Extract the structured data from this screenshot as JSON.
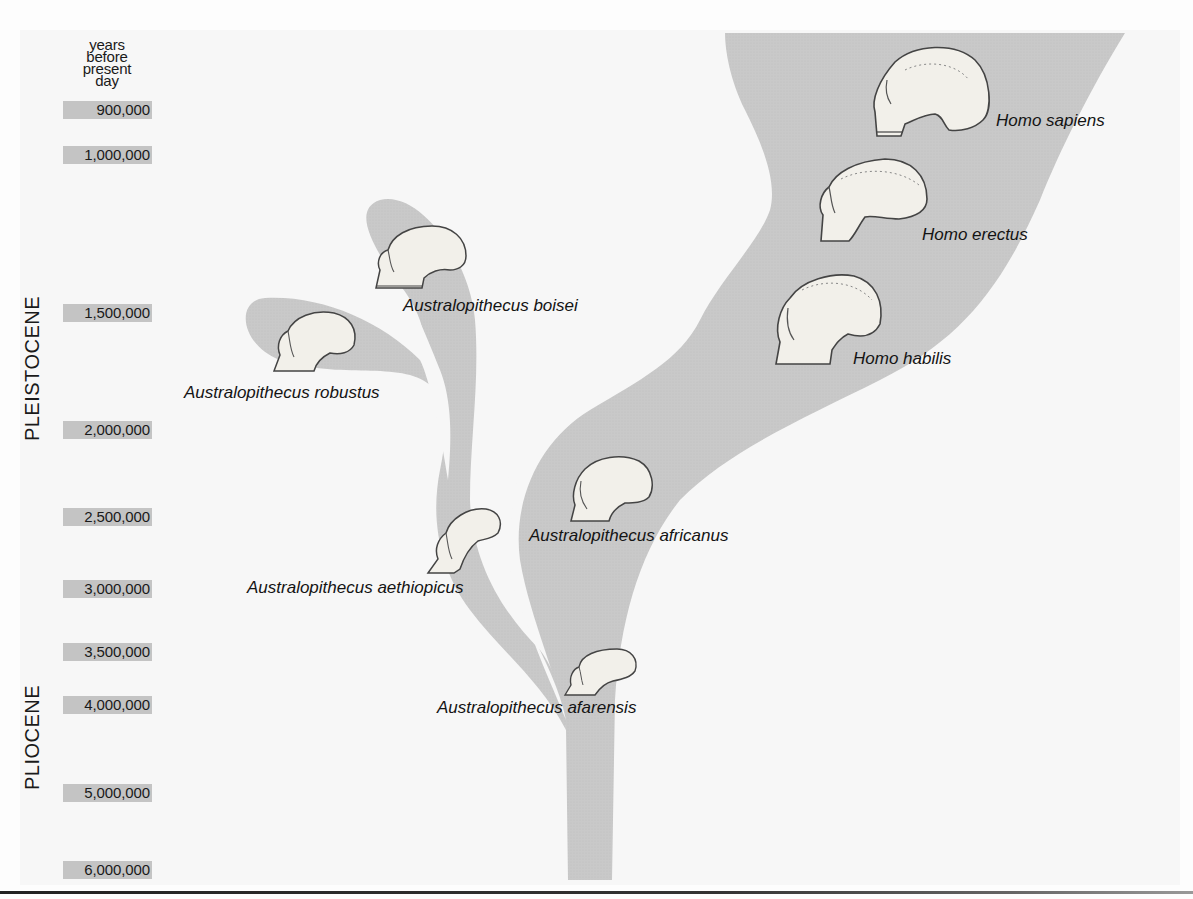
{
  "figure": {
    "type": "hominid evolutionary tree",
    "background_color": "#fdfdfd",
    "branch_color": "#c9c9c9",
    "tick_box_color": "#c4c4c4"
  },
  "axis": {
    "header": [
      "years",
      "before",
      "present",
      "day"
    ],
    "ticks": [
      {
        "label": "900,000",
        "y": 101
      },
      {
        "label": "1,000,000",
        "y": 146
      },
      {
        "label": "1,500,000",
        "y": 304
      },
      {
        "label": "2,000,000",
        "y": 421
      },
      {
        "label": "2,500,000",
        "y": 508
      },
      {
        "label": "3,000,000",
        "y": 580
      },
      {
        "label": "3,500,000",
        "y": 643
      },
      {
        "label": "4,000,000",
        "y": 696
      },
      {
        "label": "5,000,000",
        "y": 784
      },
      {
        "label": "6,000,000",
        "y": 861
      }
    ]
  },
  "epochs": [
    {
      "label": "PLEISTOCENE"
    },
    {
      "label": "PLIOCENE"
    }
  ],
  "species": [
    {
      "name": "Homo sapiens"
    },
    {
      "name": "Homo erectus"
    },
    {
      "name": "Homo habilis"
    },
    {
      "name": "Australopithecus boisei"
    },
    {
      "name": "Australopithecus robustus"
    },
    {
      "name": "Australopithecus africanus"
    },
    {
      "name": "Australopithecus aethiopicus"
    },
    {
      "name": "Australopithecus afarensis"
    }
  ]
}
